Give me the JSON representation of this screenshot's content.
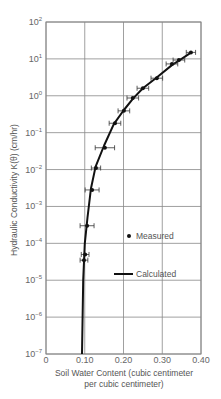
{
  "chart_data": {
    "type": "scatter",
    "title": "",
    "xlabel": "Soil Water Content (cubic centimeter per cubic centimeter)",
    "xlabel_lines": [
      "Soil Water Content (cubic centimeter",
      "per cubic centimeter)"
    ],
    "ylabel": "Hydraulic Conductivity K(θ) (cm/hr)",
    "xlim": [
      0,
      0.4
    ],
    "ylim": [
      1e-07,
      100
    ],
    "yscale": "log",
    "grid": true,
    "x_ticks": [
      0,
      0.1,
      0.2,
      0.3,
      0.4
    ],
    "x_tick_labels": [
      "0",
      "0.10",
      "0.20",
      "0.30",
      "0.40"
    ],
    "y_tick_exponents": [
      2,
      1,
      0,
      -1,
      -2,
      -3,
      -4,
      -5,
      -6,
      -7
    ],
    "y_tick_labels": [
      "10^2",
      "10^1",
      "10^0",
      "10^-1",
      "10^-2",
      "10^-3",
      "10^-4",
      "10^-5",
      "10^-6",
      "10^-7"
    ],
    "legend": {
      "position": "lower right inside",
      "entries": [
        {
          "label": "Measured",
          "marker": "dot"
        },
        {
          "label": "Calculated",
          "marker": "line"
        }
      ]
    },
    "series": [
      {
        "name": "Measured",
        "style": "points-with-x-errorbars",
        "points": [
          {
            "x": 0.374,
            "y": 15,
            "xerr": 0.012
          },
          {
            "x": 0.343,
            "y": 9.3,
            "xerr": 0.015
          },
          {
            "x": 0.325,
            "y": 7.3,
            "xerr": 0.015
          },
          {
            "x": 0.286,
            "y": 3.0,
            "xerr": 0.015
          },
          {
            "x": 0.25,
            "y": 1.6,
            "xerr": 0.015
          },
          {
            "x": 0.224,
            "y": 0.87,
            "xerr": 0.015
          },
          {
            "x": 0.201,
            "y": 0.39,
            "xerr": 0.015
          },
          {
            "x": 0.178,
            "y": 0.18,
            "xerr": 0.015
          },
          {
            "x": 0.152,
            "y": 0.039,
            "xerr": 0.025
          },
          {
            "x": 0.129,
            "y": 0.011,
            "xerr": 0.012
          },
          {
            "x": 0.119,
            "y": 0.0028,
            "xerr": 0.018
          },
          {
            "x": 0.106,
            "y": 0.0003,
            "xerr": 0.018
          },
          {
            "x": 0.101,
            "y": 5e-05,
            "xerr": 0.01
          },
          {
            "x": 0.098,
            "y": 3.5e-05,
            "xerr": 0.01
          }
        ]
      },
      {
        "name": "Calculated",
        "style": "line",
        "points": [
          {
            "x": 0.093,
            "y": 1e-07
          },
          {
            "x": 0.096,
            "y": 1e-05
          },
          {
            "x": 0.1,
            "y": 0.0001
          },
          {
            "x": 0.107,
            "y": 0.0005
          },
          {
            "x": 0.116,
            "y": 0.003
          },
          {
            "x": 0.128,
            "y": 0.012
          },
          {
            "x": 0.15,
            "y": 0.045
          },
          {
            "x": 0.175,
            "y": 0.17
          },
          {
            "x": 0.2,
            "y": 0.4
          },
          {
            "x": 0.225,
            "y": 0.85
          },
          {
            "x": 0.25,
            "y": 1.6
          },
          {
            "x": 0.285,
            "y": 3.1
          },
          {
            "x": 0.325,
            "y": 6.8
          },
          {
            "x": 0.35,
            "y": 10
          },
          {
            "x": 0.375,
            "y": 15
          }
        ]
      }
    ]
  },
  "style": {
    "line_color": "#111111",
    "grid_color": "#888888",
    "text_color": "#555555"
  }
}
